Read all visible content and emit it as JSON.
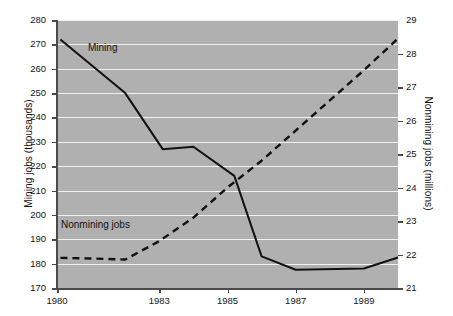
{
  "chart_data": {
    "type": "line",
    "title": "",
    "subtitle": "",
    "xlabel": "",
    "ylabel": "Mining jobs (thousands)",
    "y2label": "Nonmining jobs (millions)",
    "grid": true,
    "gridlines": "horizontal",
    "legend_position": "inline-annotation",
    "background": "#b0b0b0",
    "gridline_color": "#f2f2f2",
    "line_color": "#111111",
    "xlim": [
      1980,
      1990
    ],
    "xticks": [
      1980,
      1983,
      1985,
      1987,
      1989
    ],
    "xticklabels": [
      "1980",
      "1983",
      "1985",
      "1987",
      "1989"
    ],
    "ylim": [
      170,
      280
    ],
    "yticks": [
      170,
      180,
      190,
      200,
      210,
      220,
      230,
      240,
      250,
      260,
      270,
      280
    ],
    "yticklabels": [
      "170",
      "180",
      "190",
      "200",
      "210",
      "220",
      "230",
      "240",
      "250",
      "260",
      "270",
      "280"
    ],
    "y2lim": [
      21,
      29
    ],
    "y2ticks": [
      21,
      22,
      23,
      24,
      25,
      26,
      27,
      28,
      29
    ],
    "y2ticklabels": [
      "21",
      "22",
      "23",
      "24",
      "25",
      "26",
      "27",
      "28",
      "29"
    ],
    "series": [
      {
        "name": "Mining",
        "label": "Mining",
        "axis": "left",
        "style": "solid",
        "units": "thousands",
        "x": [
          1980.1,
          1982.0,
          1983.1,
          1984.0,
          1985.2,
          1986.0,
          1987.0,
          1989.0,
          1990.0
        ],
        "values": [
          272,
          250,
          227,
          228,
          216,
          183,
          177.5,
          178,
          182.5
        ]
      },
      {
        "name": "Nonmining jobs",
        "label": "Nonmining jobs",
        "axis": "right",
        "style": "dashed",
        "units": "millions",
        "x": [
          1980.1,
          1981.0,
          1982.0,
          1983.0,
          1984.0,
          1985.0,
          1986.0,
          1987.0,
          1988.0,
          1989.0,
          1990.0
        ],
        "values": [
          21.9,
          21.88,
          21.85,
          22.4,
          23.1,
          24.0,
          24.8,
          25.7,
          26.6,
          27.5,
          28.45
        ]
      }
    ]
  },
  "annotations": {
    "mining_label": "Mining",
    "nonmining_label": "Nonmining jobs"
  }
}
